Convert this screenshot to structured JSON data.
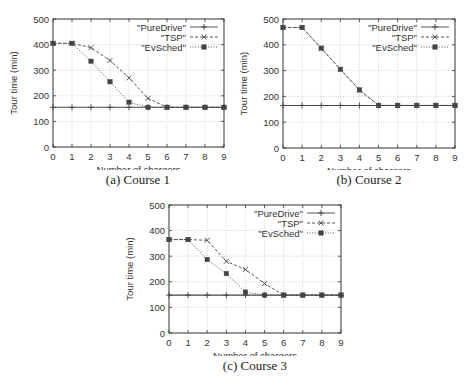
{
  "chart_data": [
    {
      "type": "line",
      "title": "",
      "caption": "(a) Course 1",
      "xlabel": "Number of chargers",
      "ylabel": "Tour time (min)",
      "x": [
        0,
        1,
        2,
        3,
        4,
        5,
        6,
        7,
        8,
        9
      ],
      "xlim": [
        0,
        9
      ],
      "ylim": [
        0,
        500
      ],
      "yticks": [
        0,
        100,
        200,
        300,
        400,
        500
      ],
      "grid": true,
      "legend_position": "upper right",
      "series": [
        {
          "name": "\"PureDrive\"",
          "style": "solid",
          "marker": "+",
          "values": [
            155,
            155,
            155,
            155,
            155,
            155,
            155,
            155,
            155,
            155
          ]
        },
        {
          "name": "\"TSP\"",
          "style": "dashed",
          "marker": "x",
          "values": [
            405,
            405,
            388,
            338,
            270,
            190,
            155,
            155,
            155,
            155
          ]
        },
        {
          "name": "\"EvSched\"",
          "style": "dotted",
          "marker": "square",
          "values": [
            405,
            405,
            335,
            255,
            175,
            155,
            155,
            155,
            155,
            155
          ]
        }
      ]
    },
    {
      "type": "line",
      "title": "",
      "caption": "(b) Course 2",
      "xlabel": "Number of chargers",
      "ylabel": "Tour time (min)",
      "x": [
        0,
        1,
        2,
        3,
        4,
        5,
        6,
        7,
        8,
        9
      ],
      "xlim": [
        0,
        9
      ],
      "ylim": [
        0,
        500
      ],
      "yticks": [
        0,
        100,
        200,
        300,
        400,
        500
      ],
      "grid": true,
      "legend_position": "upper right",
      "series": [
        {
          "name": "\"PureDrive\"",
          "style": "solid",
          "marker": "+",
          "values": [
            165,
            165,
            165,
            165,
            165,
            165,
            165,
            165,
            165,
            165
          ]
        },
        {
          "name": "\"TSP\"",
          "style": "dashed",
          "marker": "x",
          "values": [
            467,
            467,
            387,
            305,
            225,
            165,
            165,
            165,
            165,
            165
          ]
        },
        {
          "name": "\"EvSched\"",
          "style": "dotted",
          "marker": "square",
          "values": [
            467,
            467,
            387,
            305,
            225,
            165,
            165,
            165,
            165,
            165
          ]
        }
      ]
    },
    {
      "type": "line",
      "title": "",
      "caption": "(c) Course 3",
      "xlabel": "Number of chargers",
      "ylabel": "Tour time (min)",
      "x": [
        0,
        1,
        2,
        3,
        4,
        5,
        6,
        7,
        8,
        9
      ],
      "xlim": [
        0,
        9
      ],
      "ylim": [
        0,
        500
      ],
      "yticks": [
        0,
        100,
        200,
        300,
        400,
        500
      ],
      "grid": true,
      "legend_position": "upper right",
      "series": [
        {
          "name": "\"PureDrive\"",
          "style": "solid",
          "marker": "+",
          "values": [
            148,
            148,
            148,
            148,
            148,
            148,
            148,
            148,
            148,
            148
          ]
        },
        {
          "name": "\"TSP\"",
          "style": "dashed",
          "marker": "x",
          "values": [
            365,
            365,
            362,
            280,
            248,
            193,
            148,
            148,
            148,
            148
          ]
        },
        {
          "name": "\"EvSched\"",
          "style": "dotted",
          "marker": "square",
          "values": [
            365,
            365,
            287,
            232,
            160,
            148,
            148,
            148,
            148,
            148
          ]
        }
      ]
    }
  ],
  "colors": {
    "axis": "#333333",
    "grid": "#c8c8c8",
    "series": "#444444",
    "text": "#333333"
  }
}
